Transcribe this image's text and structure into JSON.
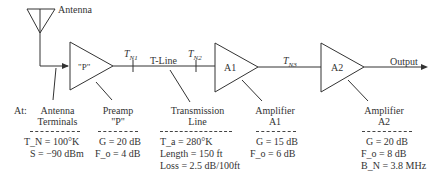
{
  "diagram": {
    "antenna_label": "Antenna",
    "output_label": "Output",
    "tline_label": "T-Line",
    "blocks": [
      {
        "id": "preamp",
        "label": "\"P\""
      },
      {
        "id": "a1",
        "label": "A1"
      },
      {
        "id": "a2",
        "label": "A2"
      }
    ],
    "noise_points": [
      {
        "label": "T",
        "sub": "N1"
      },
      {
        "label": "T",
        "sub": "N2"
      },
      {
        "label": "T",
        "sub": "N3"
      }
    ],
    "at_label": "At:"
  },
  "stages": [
    {
      "title1": "Antenna",
      "title2": "Terminals",
      "params": [
        "T_N = 100°K",
        "S = −90 dBm"
      ]
    },
    {
      "title1": "Preamp",
      "title2": "\"P\"",
      "params": [
        "G = 20 dB",
        "F_o = 4 dB"
      ]
    },
    {
      "title1": "Transmission",
      "title2": "Line",
      "params": [
        "T_a = 280°K",
        "Length = 150 ft",
        "Loss = 2.5 dB/100ft"
      ]
    },
    {
      "title1": "Amplifier",
      "title2": "A1",
      "params": [
        "G = 15 dB",
        "F_o = 6 dB"
      ]
    },
    {
      "title1": "Amplifier",
      "title2": "A2",
      "params": [
        "G = 20 dB",
        "F_o = 8 dB",
        "B_N = 3.8 MHz"
      ]
    }
  ]
}
